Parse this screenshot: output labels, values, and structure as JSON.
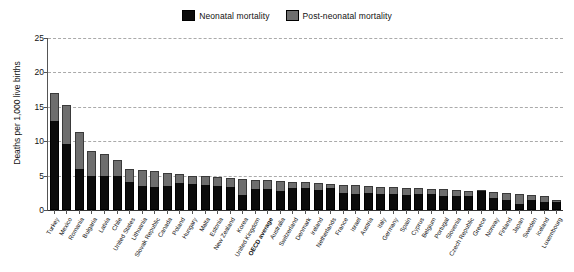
{
  "legend": {
    "position": "top-center",
    "entries": [
      {
        "label": "Neonatal mortality",
        "color": "#0b0b0b",
        "key": "neonatal"
      },
      {
        "label": "Post-neonatal mortality",
        "color": "#6e6e6e",
        "key": "post_neonatal"
      }
    ]
  },
  "axes": {
    "y_title": "Deaths per 1,000 live births",
    "y_ticks": [
      "0",
      "5",
      "10",
      "15",
      "20",
      "25"
    ],
    "y_min": 0,
    "y_max": 25,
    "grid": "horizontal-dashed"
  },
  "chart_data": {
    "type": "bar",
    "subtype": "stacked-vertical",
    "title": "",
    "subtitle": "",
    "xlabel": "",
    "ylabel": "Deaths per 1,000 live births",
    "ylim": [
      0,
      25
    ],
    "ytick_step": 5,
    "grid": true,
    "legend_position": "top-center",
    "highlight_category": "OECD average",
    "categories": [
      "Turkey",
      "Mexico",
      "Romania",
      "Bulgaria",
      "Latvia",
      "Chile",
      "United States",
      "Lithuania",
      "Slovak Republic",
      "Canada",
      "Poland",
      "Hungary",
      "Malta",
      "Estonia",
      "New Zealand",
      "Korea",
      "United Kingdom",
      "OECD average",
      "Australia",
      "Switzerland",
      "Denmark",
      "Ireland",
      "Netherlands",
      "France",
      "Israel",
      "Austria",
      "Italy",
      "Germany",
      "Spain",
      "Cyprus",
      "Belgium",
      "Portugal",
      "Slovenia",
      "Czech Republic",
      "Greece",
      "Norway",
      "Finland",
      "Japan",
      "Sweden",
      "Iceland",
      "Luxembourg"
    ],
    "series": [
      {
        "name": "Neonatal mortality",
        "color": "#0b0b0b",
        "values": [
          13.0,
          9.6,
          6.0,
          5.0,
          5.0,
          5.0,
          4.0,
          3.5,
          3.3,
          3.5,
          3.9,
          3.8,
          3.7,
          3.5,
          3.4,
          2.2,
          3.0,
          3.0,
          2.7,
          3.2,
          3.2,
          2.9,
          3.2,
          2.5,
          2.3,
          2.5,
          2.4,
          2.3,
          2.2,
          2.3,
          2.4,
          2.1,
          2.0,
          2.0,
          2.7,
          1.7,
          1.4,
          0.9,
          1.5,
          1.2,
          1.2
        ]
      },
      {
        "name": "Post-neonatal mortality",
        "color": "#6e6e6e",
        "values": [
          4.0,
          5.6,
          5.3,
          3.6,
          3.2,
          2.2,
          2.0,
          2.3,
          2.3,
          1.9,
          1.3,
          1.2,
          1.2,
          1.3,
          1.3,
          2.3,
          1.4,
          1.3,
          1.5,
          0.9,
          0.8,
          1.0,
          0.6,
          1.2,
          1.3,
          1.0,
          1.0,
          1.0,
          1.0,
          0.9,
          0.7,
          0.9,
          0.9,
          0.8,
          0.1,
          0.9,
          1.1,
          1.4,
          0.7,
          0.9,
          0.2
        ]
      }
    ],
    "totals": [
      17.0,
      15.2,
      11.3,
      8.6,
      8.2,
      7.2,
      6.0,
      5.8,
      5.6,
      5.4,
      5.2,
      5.0,
      4.9,
      4.8,
      4.7,
      4.5,
      4.4,
      4.3,
      4.2,
      4.1,
      4.0,
      3.9,
      3.8,
      3.7,
      3.6,
      3.5,
      3.4,
      3.3,
      3.2,
      3.2,
      3.1,
      3.0,
      2.9,
      2.8,
      2.8,
      2.6,
      2.5,
      2.3,
      2.2,
      2.1,
      1.4
    ]
  }
}
